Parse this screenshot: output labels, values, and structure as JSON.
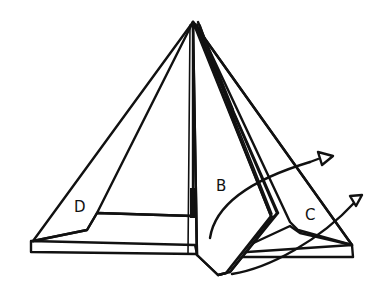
{
  "figure": {
    "stroke_color": "#111111",
    "background": "#ffffff"
  },
  "labels": {
    "panel_b": "B",
    "panel_c": "C",
    "panel_d": "D"
  },
  "arrows": [
    {
      "name": "fold-arrow-b",
      "direction": "outward-right",
      "description": "curved arrow sweeping from panel B toward the right"
    },
    {
      "name": "fold-arrow-c",
      "direction": "outward-right",
      "description": "curved arrow sweeping from panel C toward the upper right"
    }
  ]
}
